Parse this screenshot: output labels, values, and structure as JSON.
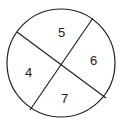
{
  "diagram": {
    "type": "circle-divided-into-sectors",
    "regions": [
      {
        "label": "5",
        "position": "top"
      },
      {
        "label": "6",
        "position": "right"
      },
      {
        "label": "7",
        "position": "bottom"
      },
      {
        "label": "4",
        "position": "left"
      }
    ],
    "stroke_color": "#222222",
    "fill_color": "#ffffff"
  }
}
